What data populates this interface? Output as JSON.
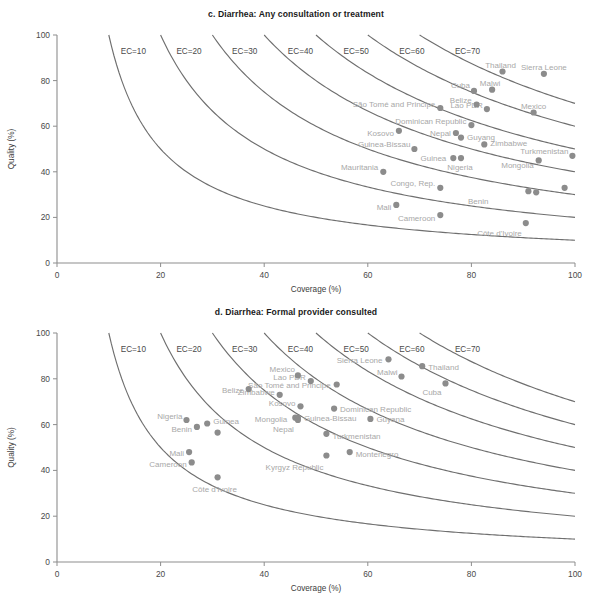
{
  "figure": {
    "axis": {
      "xlabel": "Coverage (%)",
      "ylabel": "Quality (%)",
      "xticks": [
        "0",
        "20",
        "40",
        "60",
        "80",
        "100"
      ],
      "yticks": [
        "0",
        "20",
        "40",
        "60",
        "80",
        "100"
      ],
      "xlim": [
        0,
        100
      ],
      "ylim": [
        0,
        100
      ]
    },
    "colors": {
      "dot": "#8c8c8c",
      "curve": "#6f6f6f",
      "axis": "#8d8d8d",
      "label": "#a8a8a8",
      "title": "#1a1a1a"
    }
  },
  "chart_data": [
    {
      "type": "scatter",
      "panel": "c",
      "title": "c. Diarrhea: Any consultation or treatment",
      "xlabel": "Coverage (%)",
      "ylabel": "Quality (%)",
      "xlim": [
        0,
        100
      ],
      "ylim": [
        0,
        100
      ],
      "grid": false,
      "legend": "none",
      "annotations": [
        "EC=10",
        "EC=20",
        "EC=30",
        "EC=40",
        "EC=50",
        "EC=60",
        "EC=70"
      ],
      "iso_curves": {
        "label_prefix": "EC=",
        "levels": [
          10,
          20,
          30,
          40,
          50,
          60,
          70
        ],
        "formula": "quality = EC / coverage * 100"
      },
      "points": [
        {
          "label": "Thailand",
          "x": 86.0,
          "y": 84.0,
          "label_dx": -2,
          "label_dy": -7,
          "anchor": "middle"
        },
        {
          "label": "Sierra Leone",
          "x": 94.0,
          "y": 83.0,
          "label_dx": 0,
          "label_dy": -7,
          "anchor": "middle"
        },
        {
          "label": "Malwi",
          "x": 84.0,
          "y": 76.0,
          "label_dx": -2,
          "label_dy": -7,
          "anchor": "middle"
        },
        {
          "label": "Cuba",
          "x": 80.5,
          "y": 75.5,
          "label_dx": -4,
          "label_dy": -6,
          "anchor": "end"
        },
        {
          "label": "Belize",
          "x": 81.0,
          "y": 69.5,
          "label_dx": -5,
          "label_dy": -5,
          "anchor": "end"
        },
        {
          "label": "São Tomé and Principe",
          "x": 74.0,
          "y": 68.0,
          "label_dx": -5,
          "label_dy": -4,
          "anchor": "end"
        },
        {
          "label": "Lao PDR",
          "x": 83.0,
          "y": 67.5,
          "label_dx": -4,
          "label_dy": -4,
          "anchor": "end"
        },
        {
          "label": "Mexico",
          "x": 92.0,
          "y": 66.0,
          "label_dx": 0,
          "label_dy": -7,
          "anchor": "middle"
        },
        {
          "label": "Dominican Republic",
          "x": 80.0,
          "y": 60.5,
          "label_dx": -5,
          "label_dy": -4,
          "anchor": "end"
        },
        {
          "label": "Kosovo",
          "x": 66.0,
          "y": 58.0,
          "label_dx": -5,
          "label_dy": 2,
          "anchor": "end"
        },
        {
          "label": "Nepal",
          "x": 77.0,
          "y": 57.0,
          "label_dx": -5,
          "label_dy": 0,
          "anchor": "end"
        },
        {
          "label": "Guyang",
          "x": 78.0,
          "y": 55.0,
          "label_dx": 6,
          "label_dy": -1,
          "anchor": "start"
        },
        {
          "label": "Zimbabwe",
          "x": 82.5,
          "y": 52.0,
          "label_dx": 6,
          "label_dy": -1,
          "anchor": "start"
        },
        {
          "label": "Guinea-Bissau",
          "x": 69.0,
          "y": 50.0,
          "label_dx": -4,
          "label_dy": -5,
          "anchor": "end"
        },
        {
          "label": "Turkmenistan",
          "x": 99.5,
          "y": 47.0,
          "label_dx": -4,
          "label_dy": -5,
          "anchor": "end"
        },
        {
          "label": "Nigeria",
          "x": 78.0,
          "y": 46.0,
          "label_dx": -1,
          "label_dy": 9,
          "anchor": "middle"
        },
        {
          "label": "Guinea",
          "x": 76.5,
          "y": 46.0,
          "label_dx": -7,
          "label_dy": 0,
          "anchor": "end"
        },
        {
          "label": "Mongolia",
          "x": 93.0,
          "y": 45.0,
          "label_dx": -5,
          "label_dy": 5,
          "anchor": "end"
        },
        {
          "label": "Mauritania",
          "x": 63.0,
          "y": 40.0,
          "label_dx": -5,
          "label_dy": -5,
          "anchor": "end"
        },
        {
          "label": "Congo, Rep.",
          "x": 74.0,
          "y": 33.0,
          "label_dx": -5,
          "label_dy": -5,
          "anchor": "end"
        },
        {
          "label": "Benin",
          "x": 91.0,
          "y": 31.5,
          "label_dx": -40,
          "label_dy": 10,
          "anchor": "end"
        },
        {
          "label": "",
          "x": 92.5,
          "y": 31.0,
          "label_dx": 0,
          "label_dy": 0,
          "anchor": "middle"
        },
        {
          "label": "",
          "x": 98.0,
          "y": 33.0,
          "label_dx": 0,
          "label_dy": 0,
          "anchor": "middle"
        },
        {
          "label": "Mali",
          "x": 65.5,
          "y": 25.5,
          "label_dx": -5,
          "label_dy": 2,
          "anchor": "end"
        },
        {
          "label": "Cameroon",
          "x": 74.0,
          "y": 21.0,
          "label_dx": -5,
          "label_dy": 3,
          "anchor": "end"
        },
        {
          "label": "Côte d'Ivoire",
          "x": 90.5,
          "y": 17.5,
          "label_dx": -4,
          "label_dy": 10,
          "anchor": "end"
        }
      ]
    },
    {
      "type": "scatter",
      "panel": "d",
      "title": "d. Diarrhea: Formal provider consulted",
      "xlabel": "Coverage (%)",
      "ylabel": "Quality (%)",
      "xlim": [
        0,
        100
      ],
      "ylim": [
        0,
        100
      ],
      "grid": false,
      "legend": "none",
      "annotations": [
        "EC=10",
        "EC=20",
        "EC=30",
        "EC=40",
        "EC=50",
        "EC=60",
        "EC=70"
      ],
      "iso_curves": {
        "label_prefix": "EC=",
        "levels": [
          10,
          20,
          30,
          40,
          50,
          60,
          70
        ],
        "formula": "quality = EC / coverage * 100"
      },
      "points": [
        {
          "label": "Sierra Leone",
          "x": 64.0,
          "y": 88.5,
          "label_dx": -6,
          "label_dy": 1,
          "anchor": "end"
        },
        {
          "label": "Thailand",
          "x": 70.5,
          "y": 85.5,
          "label_dx": 6,
          "label_dy": 1,
          "anchor": "start"
        },
        {
          "label": "Mexico",
          "x": 46.5,
          "y": 81.5,
          "label_dx": -3,
          "label_dy": -6,
          "anchor": "end"
        },
        {
          "label": "Malwi",
          "x": 66.5,
          "y": 81.0,
          "label_dx": -4,
          "label_dy": -5,
          "anchor": "end"
        },
        {
          "label": "Lao PDR",
          "x": 49.0,
          "y": 79.0,
          "label_dx": -5,
          "label_dy": -4,
          "anchor": "end"
        },
        {
          "label": "Cuba",
          "x": 75.0,
          "y": 78.0,
          "label_dx": -4,
          "label_dy": 9,
          "anchor": "end"
        },
        {
          "label": "São Tomé and Principe",
          "x": 54.0,
          "y": 77.5,
          "label_dx": -6,
          "label_dy": 0,
          "anchor": "end"
        },
        {
          "label": "Belize",
          "x": 37.0,
          "y": 75.5,
          "label_dx": -5,
          "label_dy": 1,
          "anchor": "end"
        },
        {
          "label": "Zimbabwe",
          "x": 43.0,
          "y": 73.0,
          "label_dx": -5,
          "label_dy": -3,
          "anchor": "end"
        },
        {
          "label": "Kosovo",
          "x": 47.0,
          "y": 68.0,
          "label_dx": -5,
          "label_dy": -3,
          "anchor": "end"
        },
        {
          "label": "Dominican Republic",
          "x": 53.5,
          "y": 67.0,
          "label_dx": 6,
          "label_dy": 0,
          "anchor": "start"
        },
        {
          "label": "Guinea-Bissau",
          "x": 46.5,
          "y": 63.0,
          "label_dx": 6,
          "label_dy": 0,
          "anchor": "start"
        },
        {
          "label": "Guyana",
          "x": 60.5,
          "y": 62.5,
          "label_dx": 6,
          "label_dy": 0,
          "anchor": "start"
        },
        {
          "label": "Nigeria",
          "x": 25.0,
          "y": 62.0,
          "label_dx": -4,
          "label_dy": -4,
          "anchor": "end"
        },
        {
          "label": "Mongolia",
          "x": 46.0,
          "y": 63.0,
          "label_dx": -8,
          "label_dy": 1,
          "anchor": "end"
        },
        {
          "label": "Guinea",
          "x": 29.0,
          "y": 60.5,
          "label_dx": 6,
          "label_dy": -3,
          "anchor": "start"
        },
        {
          "label": "Nepal",
          "x": 46.5,
          "y": 62.0,
          "label_dx": -4,
          "label_dy": 9,
          "anchor": "end"
        },
        {
          "label": "Benin",
          "x": 27.0,
          "y": 59.0,
          "label_dx": -5,
          "label_dy": 2,
          "anchor": "end"
        },
        {
          "label": "Turkmenistan",
          "x": 52.0,
          "y": 56.0,
          "label_dx": 6,
          "label_dy": 2,
          "anchor": "start"
        },
        {
          "label": "",
          "x": 31.0,
          "y": 56.5,
          "label_dx": 0,
          "label_dy": 0,
          "anchor": "middle"
        },
        {
          "label": "Mali",
          "x": 25.5,
          "y": 48.0,
          "label_dx": -5,
          "label_dy": 1,
          "anchor": "end"
        },
        {
          "label": "Montenegro",
          "x": 56.5,
          "y": 48.0,
          "label_dx": 6,
          "label_dy": 2,
          "anchor": "start"
        },
        {
          "label": "Kyrgyz Republic",
          "x": 52.0,
          "y": 46.5,
          "label_dx": -3,
          "label_dy": 11,
          "anchor": "end"
        },
        {
          "label": "Cameroon",
          "x": 26.0,
          "y": 43.5,
          "label_dx": -5,
          "label_dy": 2,
          "anchor": "end"
        },
        {
          "label": "Côte d'Ivoire",
          "x": 31.0,
          "y": 37.0,
          "label_dx": -3,
          "label_dy": 12,
          "anchor": "middle"
        }
      ]
    }
  ]
}
